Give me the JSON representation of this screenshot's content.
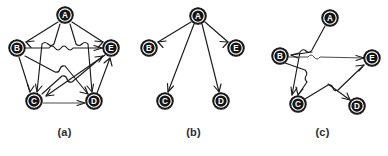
{
  "figure": {
    "background": "#ffffff",
    "ink_color": "#151515",
    "node_label_color": "#ffffff",
    "edge_color": "#1b1b1b",
    "panel_count": 3
  },
  "panels": [
    {
      "id": "panel-a",
      "caption": "(a)",
      "description": "Complete directed graph on five vertices arranged in a pentagon with crossing chords and hop-over arcs",
      "nodes": [
        {
          "id": "A",
          "label": "A",
          "x": 65,
          "y": 15
        },
        {
          "id": "B",
          "label": "B",
          "x": 17,
          "y": 48
        },
        {
          "id": "E",
          "label": "E",
          "x": 111,
          "y": 48
        },
        {
          "id": "C",
          "label": "C",
          "x": 34,
          "y": 101
        },
        {
          "id": "D",
          "label": "D",
          "x": 94,
          "y": 101
        }
      ],
      "edges": [
        {
          "from": "A",
          "to": "B"
        },
        {
          "from": "A",
          "to": "E"
        },
        {
          "from": "A",
          "to": "C"
        },
        {
          "from": "A",
          "to": "D"
        },
        {
          "from": "B",
          "to": "E"
        },
        {
          "from": "B",
          "to": "C"
        },
        {
          "from": "B",
          "to": "D"
        },
        {
          "from": "C",
          "to": "D"
        },
        {
          "from": "C",
          "to": "E"
        },
        {
          "from": "D",
          "to": "E"
        },
        {
          "from": "E",
          "to": "C"
        }
      ],
      "edge_count": 11
    },
    {
      "id": "panel-b",
      "caption": "(b)",
      "description": "Star graph: vertex A points to each of B, C, D and E",
      "nodes": [
        {
          "id": "A",
          "label": "A",
          "x": 69,
          "y": 16
        },
        {
          "id": "B",
          "label": "B",
          "x": 20,
          "y": 48
        },
        {
          "id": "E",
          "label": "E",
          "x": 107,
          "y": 48
        },
        {
          "id": "C",
          "label": "C",
          "x": 36,
          "y": 101
        },
        {
          "id": "D",
          "label": "D",
          "x": 92,
          "y": 101
        }
      ],
      "edges": [
        {
          "from": "A",
          "to": "B"
        },
        {
          "from": "A",
          "to": "E"
        },
        {
          "from": "A",
          "to": "C"
        },
        {
          "from": "A",
          "to": "D"
        }
      ],
      "edge_count": 4
    },
    {
      "id": "panel-c",
      "caption": "(c)",
      "description": "Sparse directed graph with crossing chords and hop-over arcs",
      "nodes": [
        {
          "id": "A",
          "label": "A",
          "x": 72,
          "y": 18
        },
        {
          "id": "B",
          "label": "B",
          "x": 22,
          "y": 56
        },
        {
          "id": "E",
          "label": "E",
          "x": 114,
          "y": 58
        },
        {
          "id": "C",
          "label": "C",
          "x": 40,
          "y": 104
        },
        {
          "id": "D",
          "label": "D",
          "x": 99,
          "y": 106
        }
      ],
      "edges": [
        {
          "from": "A",
          "to": "C"
        },
        {
          "from": "B",
          "to": "E"
        },
        {
          "from": "B",
          "to": "C"
        },
        {
          "from": "C",
          "to": "E"
        },
        {
          "from": "E",
          "to": "B"
        },
        {
          "from": "E",
          "to": "D"
        }
      ],
      "edge_count": 6
    }
  ]
}
